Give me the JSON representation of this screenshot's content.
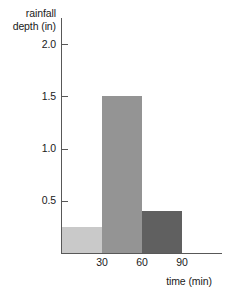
{
  "chart_data": {
    "type": "bar",
    "title": "",
    "subtitle": "",
    "xlabel": "time (min)",
    "ylabel": "rainfall depth (in)",
    "ylabel_lines": [
      "rainfall",
      "depth (in)"
    ],
    "categories": [
      "0-30",
      "30-60",
      "60-90"
    ],
    "bin_edges": [
      0,
      30,
      60,
      90
    ],
    "values": [
      0.25,
      1.5,
      0.4
    ],
    "bar_colors": [
      "#c9c9c9",
      "#949494",
      "#606060"
    ],
    "xlim": [
      0,
      105
    ],
    "ylim": [
      0,
      2.25
    ],
    "xticks": [
      30,
      60,
      90
    ],
    "xtick_labels": [
      "30",
      "60",
      "90"
    ],
    "yticks": [
      0.5,
      1.0,
      1.5,
      2.0
    ],
    "ytick_labels": [
      "0.5",
      "1.0",
      "1.5",
      "2.0"
    ],
    "grid": false,
    "legend": false,
    "legend_position": "none",
    "axis_color": "#585858",
    "background": "#ffffff"
  }
}
